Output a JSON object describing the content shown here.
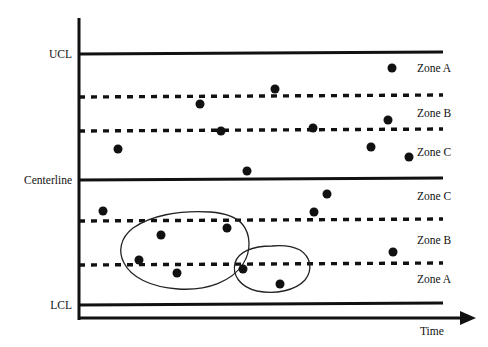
{
  "chart_data": {
    "type": "scatter",
    "title": "",
    "subtitle": "",
    "xlabel": "Time",
    "ylabel": "",
    "grid": false,
    "legend_position": "right",
    "axis": {
      "x_axis_label": "Time",
      "x_axis_arrow": true,
      "y_axis_visible": true,
      "x_range_note": "unlabeled time axis",
      "y_range_note": "unlabeled measurement axis bounded by LCL and UCL"
    },
    "control_limits": [
      {
        "name": "UCL",
        "label": "UCL",
        "y": 54,
        "style": "solid",
        "sigma": 3
      },
      {
        "name": "upper_2sigma",
        "label": "",
        "y": 97,
        "style": "dashed",
        "sigma": 2
      },
      {
        "name": "upper_1sigma",
        "label": "",
        "y": 131,
        "style": "dashed",
        "sigma": 1
      },
      {
        "name": "Centerline",
        "label": "Centerline",
        "y": 180,
        "style": "solid",
        "sigma": 0
      },
      {
        "name": "lower_1sigma",
        "label": "",
        "y": 221,
        "style": "dashed",
        "sigma": -1
      },
      {
        "name": "lower_2sigma",
        "label": "",
        "y": 265,
        "style": "dashed",
        "sigma": -2
      },
      {
        "name": "LCL",
        "label": "LCL",
        "y": 305,
        "style": "solid",
        "sigma": -3
      }
    ],
    "zone_labels": [
      {
        "label": "Zone A",
        "y": 68,
        "half": "upper",
        "sigma_band": "2 to 3"
      },
      {
        "label": "Zone B",
        "y": 113,
        "half": "upper",
        "sigma_band": "1 to 2"
      },
      {
        "label": "Zone C",
        "y": 152,
        "half": "upper",
        "sigma_band": "0 to 1"
      },
      {
        "label": "Zone C",
        "y": 196,
        "half": "lower",
        "sigma_band": "0 to -1"
      },
      {
        "label": "Zone B",
        "y": 240,
        "half": "lower",
        "sigma_band": "-1 to -2"
      },
      {
        "label": "Zone A",
        "y": 279,
        "half": "lower",
        "sigma_band": "-2 to -3"
      }
    ],
    "points": [
      {
        "x": 118,
        "y": 149
      },
      {
        "x": 200,
        "y": 104
      },
      {
        "x": 221,
        "y": 131
      },
      {
        "x": 247,
        "y": 171
      },
      {
        "x": 275,
        "y": 89
      },
      {
        "x": 313,
        "y": 128
      },
      {
        "x": 327,
        "y": 194
      },
      {
        "x": 371,
        "y": 147
      },
      {
        "x": 388,
        "y": 120
      },
      {
        "x": 392,
        "y": 68
      },
      {
        "x": 409,
        "y": 157
      },
      {
        "x": 314,
        "y": 212
      },
      {
        "x": 103,
        "y": 211
      },
      {
        "x": 161,
        "y": 235
      },
      {
        "x": 227,
        "y": 228
      },
      {
        "x": 139,
        "y": 260
      },
      {
        "x": 177,
        "y": 273
      },
      {
        "x": 243,
        "y": 269
      },
      {
        "x": 280,
        "y": 284
      },
      {
        "x": 393,
        "y": 252
      }
    ],
    "annotations": [
      {
        "name": "circled-cluster-left",
        "type": "freehand-outline",
        "description": "hand drawn loop enclosing a run of points below the centerline",
        "enclosed_point_indices": [
          13,
          14,
          15,
          16
        ]
      },
      {
        "name": "circled-cluster-right",
        "type": "freehand-outline",
        "description": "hand drawn loop enclosing two points near the lower 2-sigma limit",
        "enclosed_point_indices": [
          17,
          18
        ]
      }
    ],
    "colors": {
      "line": "#111111",
      "point": "#111111",
      "annotation": "#111111",
      "background": "#ffffff"
    }
  },
  "labels": {
    "ucl": "UCL",
    "centerline": "Centerline",
    "lcl": "LCL",
    "time": "Time",
    "zone_a": "Zone A",
    "zone_b": "Zone B",
    "zone_c": "Zone C"
  }
}
